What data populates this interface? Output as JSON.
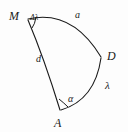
{
  "figure": {
    "name": "spherical-triangle",
    "background_color": "#fdfdfd",
    "stroke_color": "#1a1a1a",
    "vertices": [
      {
        "id": "M",
        "label": "M",
        "x": 27,
        "y": 18
      },
      {
        "id": "A",
        "label": "A",
        "x": 60,
        "y": 110
      },
      {
        "id": "D",
        "label": "D",
        "x": 101,
        "y": 57
      }
    ],
    "sides": [
      {
        "id": "a",
        "label": "a",
        "from": "M",
        "to": "D",
        "label_x": 80,
        "label_y": 15
      },
      {
        "id": "d",
        "label": "d",
        "from": "M",
        "to": "A",
        "label_x": 39,
        "label_y": 59
      },
      {
        "id": "lambda",
        "label": "λ",
        "from": "A",
        "to": "D",
        "label_x": 108,
        "label_y": 86
      }
    ],
    "angles": [
      {
        "id": "dlambda",
        "label": "Δλ",
        "at": "M",
        "label_x": 34,
        "label_y": 18
      },
      {
        "id": "alpha",
        "label": "α",
        "at": "A",
        "label_x": 71,
        "label_y": 99
      }
    ]
  }
}
